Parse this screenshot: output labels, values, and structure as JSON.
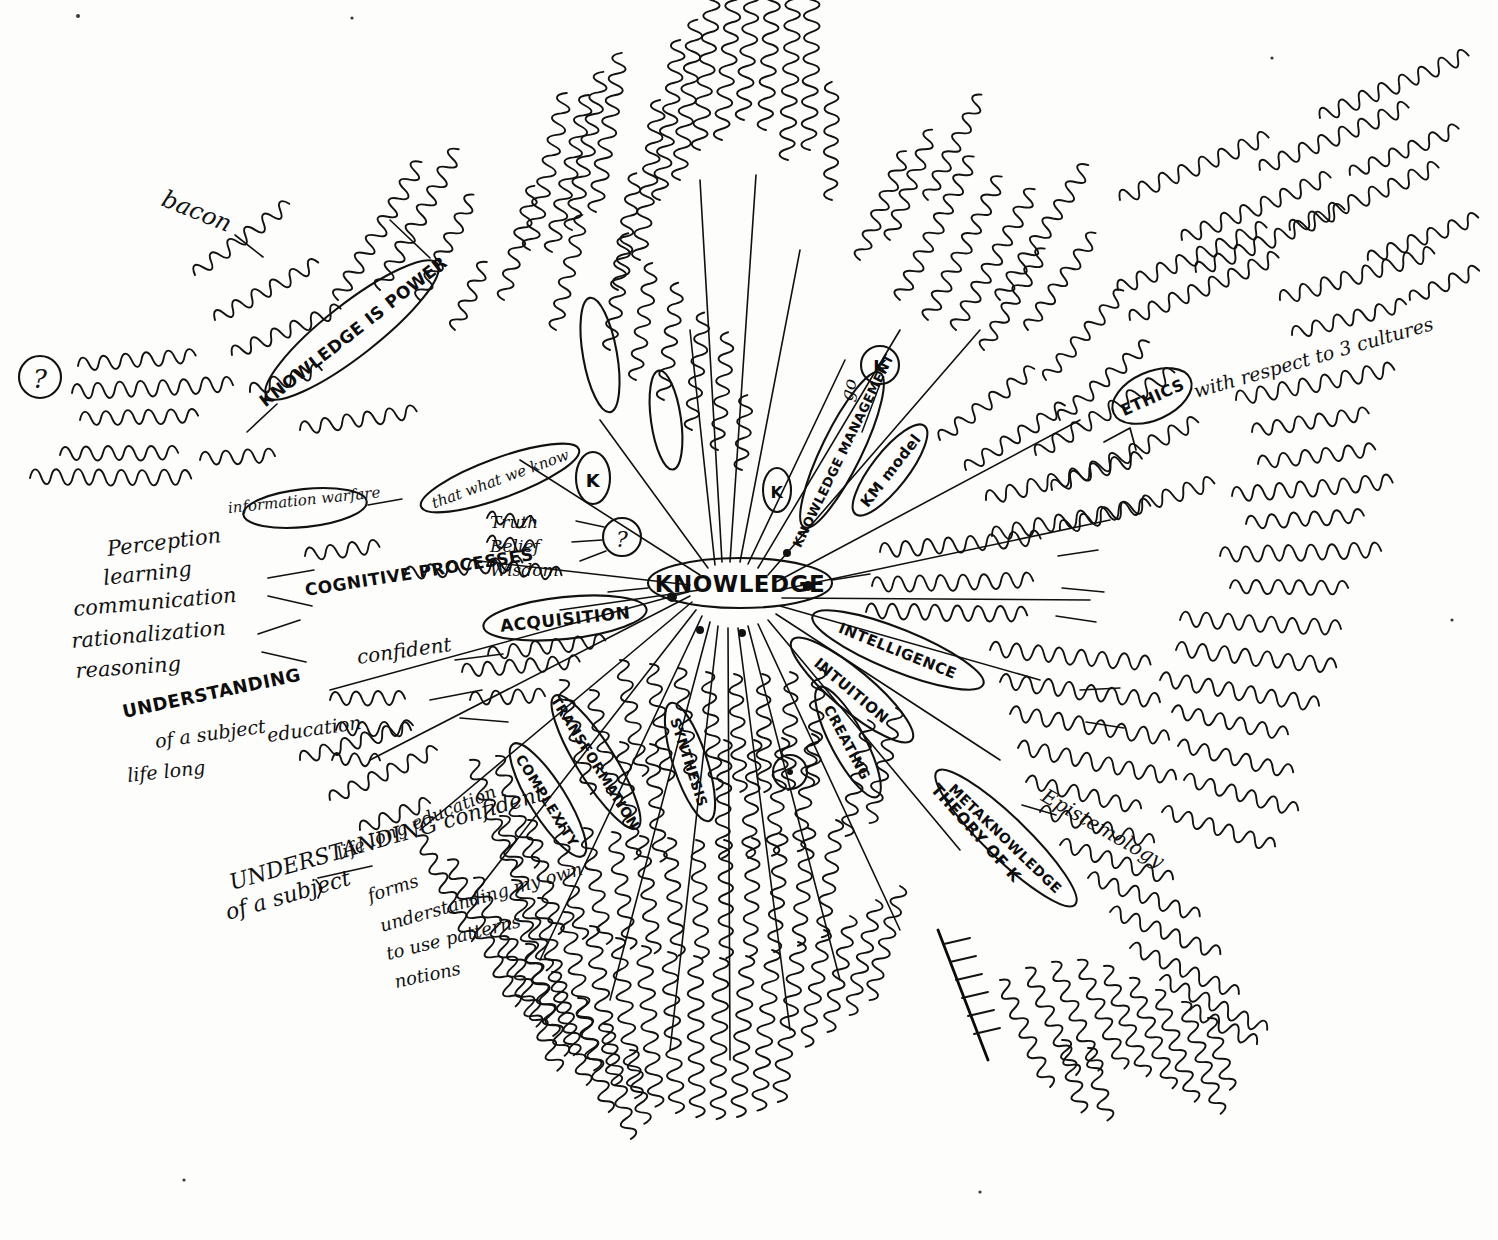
{
  "document": {
    "type": "handwritten-mind-map",
    "medium": "black ink on white paper",
    "center_label": "KNOWLEDGE",
    "page_title": "Knowledge mind map (handwritten)",
    "ink_color": "#111111",
    "paper_color": "#fdfdfc"
  },
  "center": {
    "label": "KNOWLEDGE",
    "shape": "ellipse",
    "x": 740,
    "y": 583
  },
  "branches": [
    {
      "id": "knowledge-is-power",
      "label": "KNOWLEDGE IS POWER",
      "shape": "ellipse",
      "x": 350,
      "y": 330,
      "angle": -38,
      "notes": [
        "bacon",
        "plural or diverse",
        "to life - memories",
        "K manipulation",
        "what we know",
        "K is",
        "information warfare"
      ]
    },
    {
      "id": "information-warfare",
      "label": "information warfare",
      "shape": "ellipse",
      "x": 300,
      "y": 508,
      "angle": -6,
      "notes": []
    },
    {
      "id": "what-we-know",
      "label": "that what we know",
      "shape": "ellipse",
      "x": 500,
      "y": 478,
      "angle": -20,
      "notes": [
        "Truth",
        "Belief",
        "Wisdom"
      ]
    },
    {
      "id": "cognitive-processes",
      "label": "COGNITIVE PROCESSES",
      "shape": "text",
      "x": 360,
      "y": 585,
      "angle": -10,
      "notes": [
        "involve complex",
        "Perception",
        "learning",
        "communication",
        "rationalization",
        "reasoning"
      ]
    },
    {
      "id": "understanding",
      "label": "UNDERSTANDING",
      "shape": "text",
      "x": 205,
      "y": 712,
      "angle": -13,
      "notes": [
        "confident",
        "of a subject",
        "education",
        "life long"
      ]
    },
    {
      "id": "acquisition",
      "label": "ACQUISITION",
      "shape": "ellipse",
      "x": 565,
      "y": 618,
      "angle": -7,
      "notes": [
        "men on mutually formed",
        "blue concepts",
        "networks",
        "unverb"
      ]
    },
    {
      "id": "complexity",
      "label": "COMPLEXITY",
      "shape": "ellipse",
      "x": 557,
      "y": 790,
      "angle": 58,
      "notes": [
        "categories",
        "cognition",
        "new ways of learning"
      ]
    },
    {
      "id": "transformation",
      "label": "TRANSFORMATION",
      "shape": "ellipse",
      "x": 596,
      "y": 760,
      "angle": 58,
      "notes": [
        "analyse",
        "interpret",
        "view",
        "of change"
      ]
    },
    {
      "id": "synthesis",
      "label": "SYNTHESIS",
      "shape": "ellipse",
      "x": 688,
      "y": 760,
      "angle": 72,
      "notes": [
        "evaluation",
        "deduction",
        "induction"
      ]
    },
    {
      "id": "creating",
      "label": "CREATING",
      "shape": "ellipse",
      "x": 845,
      "y": 745,
      "angle": 62,
      "notes": [
        "a new",
        "credit condition",
        "find truth"
      ]
    },
    {
      "id": "intuition",
      "label": "INTUITION",
      "shape": "ellipse",
      "x": 845,
      "y": 690,
      "angle": 40,
      "notes": [
        "ability to acquire K without reasoning",
        "immediately"
      ]
    },
    {
      "id": "intelligence",
      "label": "INTELLIGENCE",
      "shape": "ellipse",
      "x": 900,
      "y": 650,
      "angle": 22,
      "notes": [
        "many related disciplines",
        "capacity of reason"
      ]
    },
    {
      "id": "theory-of-k",
      "label": "THEORY OF K",
      "shape": "text",
      "x": 975,
      "y": 775,
      "angle": 52,
      "notes": [
        "Epistemology",
        "study the nature, scope and",
        "systematic research about"
      ]
    },
    {
      "id": "metaknowledge",
      "label": "METAKNOWLEDGE",
      "shape": "ellipse",
      "x": 1005,
      "y": 830,
      "angle": 44,
      "notes": []
    },
    {
      "id": "knowledge-management",
      "label": "KNOWLEDGE MANAGEMENT",
      "shape": "ellipse",
      "x": 840,
      "y": 455,
      "angle": -64,
      "notes": [
        "go",
        "KM model",
        "the right K",
        "delivered to the right person",
        "at the right time",
        "part in appropriate fashion"
      ]
    },
    {
      "id": "ethics",
      "label": "ETHICS",
      "shape": "circle",
      "x": 1152,
      "y": 396,
      "angle": -18,
      "notes": [
        "with respect to 3 cultures",
        "shared values",
        "religion",
        "society",
        "philosophical community",
        "construction / destruction"
      ]
    }
  ],
  "circled_marks": [
    {
      "id": "question-left",
      "label": "?",
      "x": 40,
      "y": 377
    },
    {
      "id": "question-mid",
      "label": "?",
      "x": 622,
      "y": 537
    },
    {
      "id": "k-circle-center",
      "label": "K",
      "x": 777,
      "y": 490
    },
    {
      "id": "k-circle-upper",
      "label": "K",
      "x": 880,
      "y": 365
    },
    {
      "id": "k-circle-acq",
      "label": "K",
      "x": 593,
      "y": 478
    },
    {
      "id": "dot-circle-low",
      "label": "",
      "x": 790,
      "y": 772
    }
  ],
  "annotations": {
    "top_left": [
      "bacon",
      "plural or diverse to life - memories",
      "K manipulation",
      "K is",
      "knowledge is produced in given social setting",
      "discourse / nature"
    ],
    "left": [
      "Perception",
      "learning",
      "communication",
      "rationalization",
      "reasoning",
      "UNDERSTANDING confident",
      "of a subject",
      "life long education",
      "forms",
      "understanding my own",
      "to use patterns",
      "notions",
      "codes"
    ],
    "top": [
      "language is always perfect and complete",
      "theories of learning",
      "culture",
      "myths"
    ],
    "right": [
      "state of flux",
      "problem of modern",
      "new context",
      "distribution",
      "knowledge transfer",
      "wisdom",
      "the right K model - delivered to the right person",
      "at the right time in appropriate fashion",
      "ETHICS with respect to 3 cultures",
      "shared values / religion / society",
      "philosophical community",
      "morality - codes of conduct",
      "entity, definition, structure",
      "construction / destruction",
      "many related disciplines",
      "capacity of reason",
      "without need or knowing immediately",
      "Epistemology - study the nature and scope of K",
      "evidence, research about"
    ],
    "bottom": [
      "evaluation",
      "deduction",
      "induction",
      "analyse",
      "interpret",
      "create",
      "new",
      "truth",
      "organization",
      "application",
      "individual",
      "value"
    ]
  },
  "legend": {
    "oval_meaning": "major branch node (circled in ink)",
    "line_meaning": "radial spoke from centre"
  }
}
